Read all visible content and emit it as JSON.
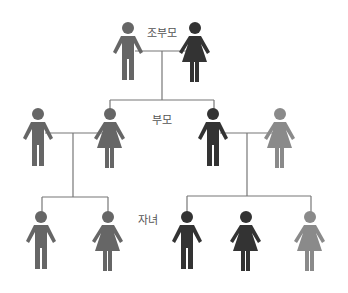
{
  "diagram": {
    "title_labels": {
      "grandparents": "조부모",
      "parents": "부모",
      "children": "자녀"
    },
    "colors": {
      "mid": "#666666",
      "dark": "#333333",
      "light": "#8a8a8a",
      "line": "#777777"
    },
    "generations": [
      {
        "name": "grandparents",
        "members": [
          {
            "gender": "male",
            "tone": "mid"
          },
          {
            "gender": "female",
            "tone": "dark"
          }
        ]
      },
      {
        "name": "parents",
        "members": [
          {
            "gender": "male",
            "tone": "mid"
          },
          {
            "gender": "female",
            "tone": "mid"
          },
          {
            "gender": "male",
            "tone": "dark"
          },
          {
            "gender": "female",
            "tone": "light"
          }
        ]
      },
      {
        "name": "children",
        "members": [
          {
            "gender": "male",
            "tone": "mid"
          },
          {
            "gender": "female",
            "tone": "mid"
          },
          {
            "gender": "male",
            "tone": "dark"
          },
          {
            "gender": "female",
            "tone": "dark"
          },
          {
            "gender": "female",
            "tone": "light"
          }
        ]
      }
    ]
  }
}
